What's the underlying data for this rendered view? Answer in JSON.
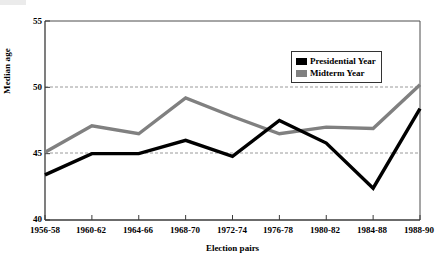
{
  "chart_data": {
    "type": "line",
    "title": "",
    "xlabel": "Election pairs",
    "ylabel": "Median age",
    "categories": [
      "1956-58",
      "1960-62",
      "1964-66",
      "1968-70",
      "1972-74",
      "1976-78",
      "1980-82",
      "1984-88",
      "1988-90"
    ],
    "series": [
      {
        "name": "Presidential Year",
        "color": "#000000",
        "values": [
          43.4,
          45.0,
          45.0,
          46.0,
          44.8,
          47.5,
          45.8,
          42.4,
          48.4
        ]
      },
      {
        "name": "Midterm Year",
        "color": "#808080",
        "values": [
          45.1,
          47.1,
          46.5,
          49.2,
          47.8,
          46.5,
          47.0,
          46.9,
          50.2
        ]
      }
    ],
    "ylim": [
      40,
      55
    ],
    "yticks": [
      40,
      45,
      50,
      55
    ],
    "ytick_labels": [
      "40",
      "45",
      "50",
      "55"
    ],
    "grid": "horizontal-dashed-at-45-and-50",
    "gridlines": [
      45,
      50
    ],
    "legend_position": "top-right-inside"
  },
  "legend": {
    "entries": [
      {
        "label": "Presidential Year",
        "color": "#000000"
      },
      {
        "label": "Midterm Year",
        "color": "#808080"
      }
    ]
  },
  "axes": {
    "y_title": "Median age",
    "x_title": "Election pairs"
  }
}
